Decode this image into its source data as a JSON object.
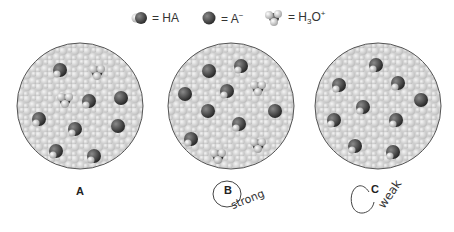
{
  "legend": {
    "items": [
      {
        "symbol": "HA",
        "label": "= HA",
        "icon": "ha-molecule-icon"
      },
      {
        "symbol": "A-",
        "label": "= A",
        "superscript": "−",
        "icon": "a-minus-ion-icon"
      },
      {
        "symbol": "H3O+",
        "label": "= H",
        "subscript": "3",
        "rest": "O",
        "superscript": "+",
        "icon": "hydronium-ion-icon"
      }
    ]
  },
  "panels": [
    {
      "id": "A",
      "label": "A",
      "annotation": "",
      "center": [
        80,
        106
      ],
      "radius": 63,
      "molecules": [
        {
          "type": "HA",
          "x": 60,
          "y": 70
        },
        {
          "type": "H3O+",
          "x": 97,
          "y": 72
        },
        {
          "type": "H3O+",
          "x": 65,
          "y": 100
        },
        {
          "type": "HA",
          "x": 89,
          "y": 101
        },
        {
          "type": "A-",
          "x": 121,
          "y": 98
        },
        {
          "type": "HA",
          "x": 39,
          "y": 119
        },
        {
          "type": "HA",
          "x": 75,
          "y": 129
        },
        {
          "type": "A-",
          "x": 118,
          "y": 126
        },
        {
          "type": "HA",
          "x": 56,
          "y": 151
        },
        {
          "type": "HA",
          "x": 94,
          "y": 156
        }
      ]
    },
    {
      "id": "B",
      "label": "B",
      "annotation": "strong",
      "center": [
        231,
        106
      ],
      "radius": 63,
      "molecules": [
        {
          "type": "A-",
          "x": 209,
          "y": 71
        },
        {
          "type": "HA",
          "x": 241,
          "y": 66
        },
        {
          "type": "A-",
          "x": 185,
          "y": 94
        },
        {
          "type": "HA",
          "x": 227,
          "y": 91
        },
        {
          "type": "H3O+",
          "x": 258,
          "y": 88
        },
        {
          "type": "A-",
          "x": 208,
          "y": 111
        },
        {
          "type": "A-",
          "x": 275,
          "y": 111
        },
        {
          "type": "HA",
          "x": 239,
          "y": 124
        },
        {
          "type": "HA",
          "x": 191,
          "y": 139
        },
        {
          "type": "H3O+",
          "x": 258,
          "y": 145
        },
        {
          "type": "H3O+",
          "x": 218,
          "y": 156
        }
      ]
    },
    {
      "id": "C",
      "label": "C",
      "annotation": "weak",
      "center": [
        378,
        106
      ],
      "radius": 63,
      "molecules": [
        {
          "type": "HA",
          "x": 376,
          "y": 65
        },
        {
          "type": "HA",
          "x": 339,
          "y": 85
        },
        {
          "type": "HA",
          "x": 398,
          "y": 83
        },
        {
          "type": "A-",
          "x": 421,
          "y": 100
        },
        {
          "type": "HA",
          "x": 363,
          "y": 107
        },
        {
          "type": "HA",
          "x": 334,
          "y": 120
        },
        {
          "type": "HA",
          "x": 396,
          "y": 120
        },
        {
          "type": "HA",
          "x": 355,
          "y": 146
        },
        {
          "type": "HA",
          "x": 393,
          "y": 152
        }
      ]
    }
  ],
  "colors": {
    "background": "#ffffff",
    "water": "#c9c9c9",
    "water_light": "#e6e6e6",
    "outline": "#555555",
    "anion_dark": "#3e3e3e",
    "hydrogen_light": "#d8d8d8"
  }
}
